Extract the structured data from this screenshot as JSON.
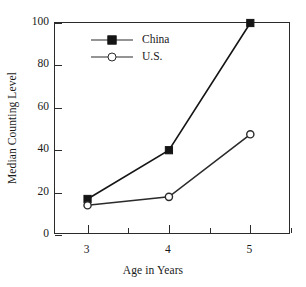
{
  "chart_data": {
    "type": "line",
    "title": "",
    "xlabel": "Age in Years",
    "ylabel": "Median Counting Level",
    "x": [
      3,
      4,
      5
    ],
    "xlim": [
      2.6,
      5.5
    ],
    "ylim": [
      0,
      100
    ],
    "yticks": [
      0,
      20,
      40,
      60,
      80,
      100
    ],
    "ytick_labels": [
      "0",
      "20",
      "40",
      "60",
      "80",
      "100"
    ],
    "xticks": [
      3,
      4,
      5
    ],
    "xtick_labels": [
      "3",
      "4",
      "5"
    ],
    "grid": false,
    "legend_position": "upper left inside",
    "series": [
      {
        "name": "China",
        "marker": "filled-square",
        "color": "#151515",
        "values": [
          17,
          40,
          100
        ]
      },
      {
        "name": "U.S.",
        "marker": "open-circle",
        "color": "#2b2b2b",
        "values": [
          14,
          18,
          47.5
        ]
      }
    ]
  },
  "legend": {
    "entries": [
      {
        "label": "China",
        "marker": "square-marker-icon"
      },
      {
        "label": "U.S.",
        "marker": "circle-marker-icon"
      }
    ]
  },
  "axes": {
    "y_title": "Median Counting Level",
    "x_title": "Age in Years"
  }
}
